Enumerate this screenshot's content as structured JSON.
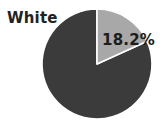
{
  "chart_data": {
    "type": "pie",
    "title": "",
    "subtitle": "",
    "xlabel": "",
    "ylabel": "",
    "legend_position": "none",
    "grid": false,
    "series_label": "White",
    "start_angle_deg": 0,
    "direction": "clockwise",
    "categories": [
      "White",
      "Other"
    ],
    "values": [
      18.2,
      81.8
    ],
    "labels": [
      "18.2%",
      ""
    ],
    "annotations": [
      "White",
      "18.2%"
    ],
    "slices": [
      {
        "name": "White",
        "value": 18.2,
        "display_label": "18.2%",
        "color": "#a8a8a8",
        "start_deg": 0,
        "end_deg": 65.52,
        "label_shown": true
      },
      {
        "name": "Other",
        "value": 81.8,
        "display_label": "",
        "color": "#3b3b3b",
        "start_deg": 65.52,
        "end_deg": 360,
        "label_shown": false
      }
    ]
  },
  "colors": {
    "background": "#ffffff",
    "slice_light": "#a8a8a8",
    "slice_dark": "#3b3b3b",
    "divider": "#ffffff",
    "text": "#222222"
  },
  "geometry": {
    "center_x": 97,
    "center_y": 64,
    "radius": 55
  },
  "label": {
    "text": "White"
  },
  "value_label": {
    "text": "18.2%"
  }
}
